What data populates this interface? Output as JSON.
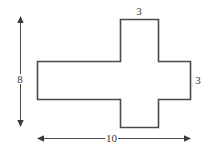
{
  "figure": {
    "kind": "geometry-diagram",
    "colors": {
      "background": "#ffffff",
      "outline": "#4a4a4a",
      "dimension_line": "#4a4a4a",
      "label_text": "#3a3a3a"
    },
    "shape": {
      "name": "cross-polygon",
      "fill": "#ffffff"
    },
    "labels": {
      "top_width": "3",
      "right_height": "3",
      "left_height": "8",
      "bottom_width": "10"
    },
    "dimensions": [
      {
        "name": "top-arm-width",
        "value": "3",
        "orientation": "horizontal",
        "position": "top"
      },
      {
        "name": "right-arm-height",
        "value": "3",
        "orientation": "vertical",
        "position": "right"
      },
      {
        "name": "overall-height",
        "value": "8",
        "orientation": "vertical",
        "position": "left"
      },
      {
        "name": "overall-width",
        "value": "10",
        "orientation": "horizontal",
        "position": "bottom"
      }
    ]
  }
}
